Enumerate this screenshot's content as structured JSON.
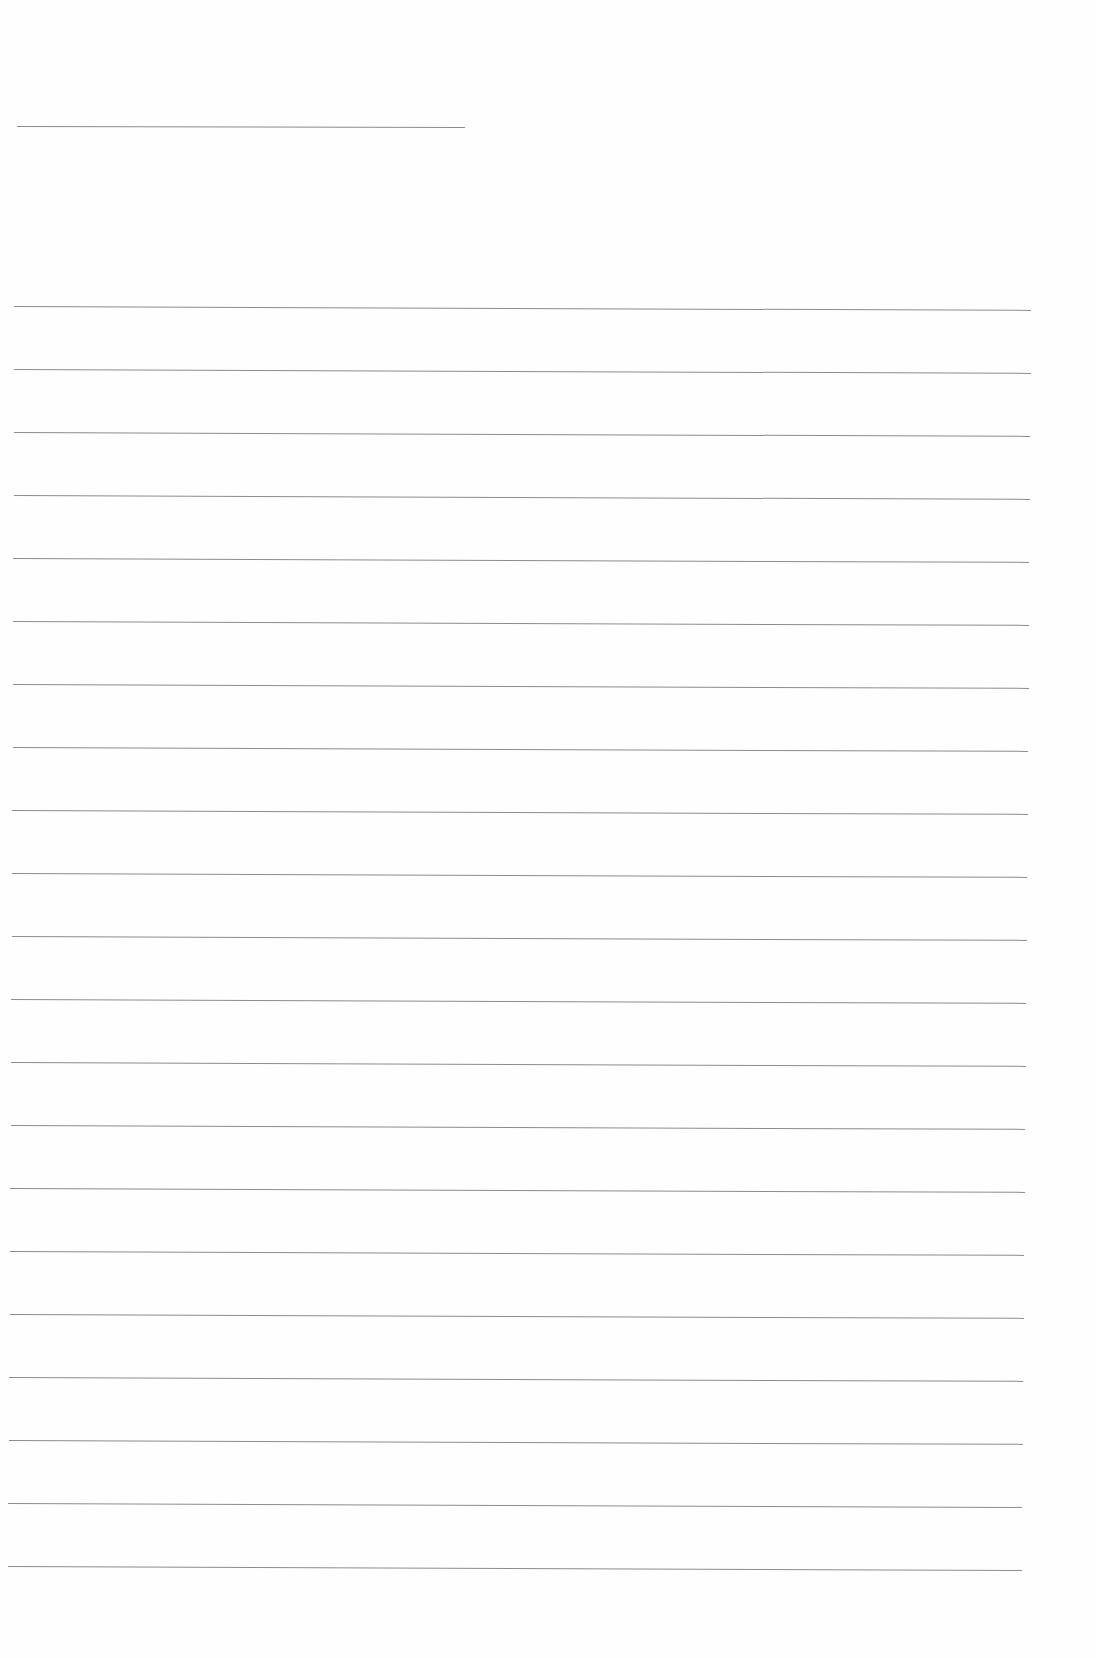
{
  "document": {
    "type": "blank lined paper",
    "text_content": "",
    "colors": {
      "paper": "#fefefe",
      "rule": "#8c8c8c"
    },
    "short_rule": {
      "x1": 17,
      "x2": 465,
      "y": 126,
      "tilt_deg": 0.12
    },
    "rules": [
      {
        "y": 306,
        "x1": 14,
        "x2": 1031
      },
      {
        "y": 369,
        "x1": 14,
        "x2": 1031
      },
      {
        "y": 432,
        "x1": 14,
        "x2": 1030
      },
      {
        "y": 495,
        "x1": 14,
        "x2": 1030
      },
      {
        "y": 558,
        "x1": 13,
        "x2": 1029
      },
      {
        "y": 621,
        "x1": 13,
        "x2": 1029
      },
      {
        "y": 684,
        "x1": 13,
        "x2": 1029
      },
      {
        "y": 747,
        "x1": 13,
        "x2": 1028
      },
      {
        "y": 810,
        "x1": 12,
        "x2": 1028
      },
      {
        "y": 873,
        "x1": 12,
        "x2": 1027
      },
      {
        "y": 936,
        "x1": 12,
        "x2": 1027
      },
      {
        "y": 999,
        "x1": 11,
        "x2": 1026
      },
      {
        "y": 1062,
        "x1": 11,
        "x2": 1026
      },
      {
        "y": 1125,
        "x1": 11,
        "x2": 1025
      },
      {
        "y": 1188,
        "x1": 10,
        "x2": 1025
      },
      {
        "y": 1251,
        "x1": 10,
        "x2": 1024
      },
      {
        "y": 1314,
        "x1": 10,
        "x2": 1024
      },
      {
        "y": 1377,
        "x1": 9,
        "x2": 1023
      },
      {
        "y": 1440,
        "x1": 9,
        "x2": 1023
      },
      {
        "y": 1503,
        "x1": 8,
        "x2": 1022
      },
      {
        "y": 1566,
        "x1": 8,
        "x2": 1022
      }
    ],
    "rule_tilt_deg": 0.22
  }
}
